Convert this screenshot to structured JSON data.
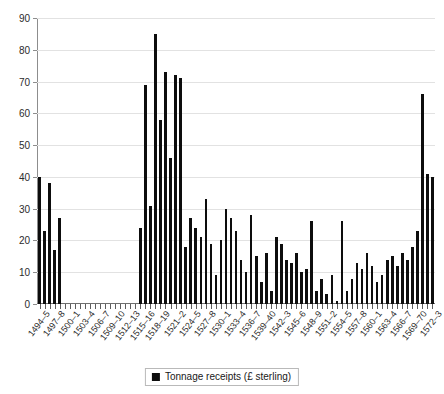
{
  "chart_data": {
    "type": "bar",
    "title": "Tonnage receipts in the port of Newcastle-upon-Tyne, 1494-5 to 1572-3",
    "xlabel": "",
    "ylabel": "",
    "ylim": [
      0,
      90
    ],
    "yticks": [
      0,
      10,
      20,
      30,
      40,
      50,
      60,
      70,
      80,
      90
    ],
    "grid": true,
    "legend_position": "bottom",
    "series_name": "Tonnage receipts (£ sterling)",
    "bar_color": "#0d0d0d",
    "categories": [
      "1494–5",
      "1495–6",
      "1496–7",
      "1497–8",
      "1498–9",
      "1499–1500",
      "1500–1",
      "1501–2",
      "1502–3",
      "1503–4",
      "1504–5",
      "1505–6",
      "1506–7",
      "1507–8",
      "1508–9",
      "1509–10",
      "1510–11",
      "1511–12",
      "1512–13",
      "1513–14",
      "1514–15",
      "1515–16",
      "1516–17",
      "1517–18",
      "1518–19",
      "1519–20",
      "1520–1",
      "1521–2",
      "1522–3",
      "1523–4",
      "1524–5",
      "1525–6",
      "1526–7",
      "1527–8",
      "1528–9",
      "1529–30",
      "1530–1",
      "1531–2",
      "1532–3",
      "1533–4",
      "1534–5",
      "1535–6",
      "1536–7",
      "1537–8",
      "1538–9",
      "1539–40",
      "1540–1",
      "1541–2",
      "1542–3",
      "1543–4",
      "1544–5",
      "1545–6",
      "1546–7",
      "1547–8",
      "1548–9",
      "1549–50",
      "1550–1",
      "1551–2",
      "1552–3",
      "1553–4",
      "1554–5",
      "1555–6",
      "1556–7",
      "1557–8",
      "1558–9",
      "1559–60",
      "1560–1",
      "1561–2",
      "1562–3",
      "1563–4",
      "1564–5",
      "1565–6",
      "1566–7",
      "1567–8",
      "1568–9",
      "1569–70",
      "1570–1",
      "1571–2",
      "1572–3"
    ],
    "values": [
      40,
      23,
      38,
      17,
      27,
      0,
      0,
      0,
      0,
      0,
      0,
      0,
      0,
      0,
      0,
      0,
      0,
      0,
      0,
      0,
      24,
      69,
      31,
      85,
      58,
      73,
      46,
      72,
      71,
      18,
      27,
      24,
      21,
      33,
      19,
      9,
      20,
      30,
      27,
      23,
      14,
      10,
      28,
      15,
      7,
      16,
      4,
      21,
      19,
      14,
      13,
      16,
      10,
      11,
      26,
      4,
      8,
      3,
      9,
      1,
      26,
      4,
      8,
      13,
      11,
      16,
      12,
      7,
      9,
      14,
      15,
      12,
      16,
      14,
      18,
      23,
      66,
      41,
      40
    ],
    "xtick_labels": [
      {
        "index": 0,
        "label": "1494–5"
      },
      {
        "index": 3,
        "label": "1497–8"
      },
      {
        "index": 6,
        "label": "1500–1"
      },
      {
        "index": 9,
        "label": "1503–4"
      },
      {
        "index": 12,
        "label": "1506–7"
      },
      {
        "index": 15,
        "label": "1509–10"
      },
      {
        "index": 18,
        "label": "1512–13"
      },
      {
        "index": 21,
        "label": "1515–16"
      },
      {
        "index": 24,
        "label": "1518–19"
      },
      {
        "index": 27,
        "label": "1521–2"
      },
      {
        "index": 30,
        "label": "1524–5"
      },
      {
        "index": 33,
        "label": "1527–8"
      },
      {
        "index": 36,
        "label": "1530–1"
      },
      {
        "index": 39,
        "label": "1533–4"
      },
      {
        "index": 42,
        "label": "1536–7"
      },
      {
        "index": 45,
        "label": "1539–40"
      },
      {
        "index": 48,
        "label": "1542–3"
      },
      {
        "index": 51,
        "label": "1545–6"
      },
      {
        "index": 54,
        "label": "1548–9"
      },
      {
        "index": 57,
        "label": "1551–2"
      },
      {
        "index": 60,
        "label": "1554–5"
      },
      {
        "index": 63,
        "label": "1557–8"
      },
      {
        "index": 66,
        "label": "1560–1"
      },
      {
        "index": 69,
        "label": "1563–4"
      },
      {
        "index": 72,
        "label": "1566–7"
      },
      {
        "index": 75,
        "label": "1569–70"
      },
      {
        "index": 78,
        "label": "1572–3"
      }
    ]
  },
  "legend": {
    "entry_label": "Tonnage receipts (£ sterling)"
  }
}
